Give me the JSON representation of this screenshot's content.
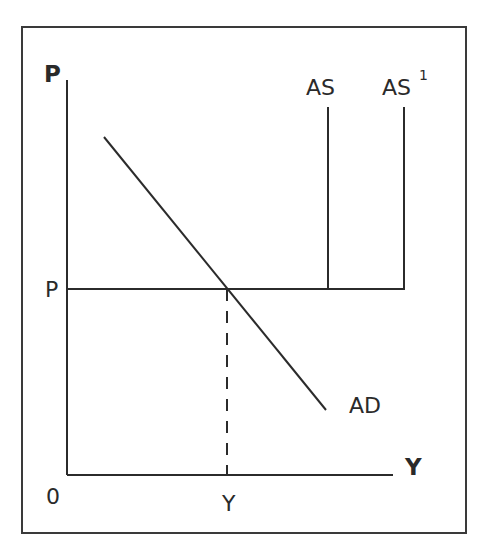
{
  "diagram": {
    "type": "economics-aggregate-supply-demand",
    "axes": {
      "y_axis_label": "P",
      "x_axis_label": "Y",
      "origin_label": "0"
    },
    "curves": {
      "ad_label": "AD",
      "as_label": "AS",
      "as1_label": "AS",
      "as1_superscript": "1"
    },
    "markers": {
      "price_level_label": "P",
      "output_level_label": "Y"
    }
  }
}
